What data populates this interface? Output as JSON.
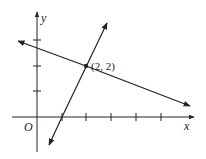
{
  "diagram": {
    "type": "coordinate-plane",
    "axes": {
      "x_label": "x",
      "y_label": "y",
      "origin_label": "O",
      "x_ticks": [
        1,
        2,
        3,
        4,
        5
      ],
      "y_ticks": [
        1,
        2,
        3
      ]
    },
    "lines": [
      {
        "name": "steep-line",
        "points": [
          [
            0.5,
            -1
          ],
          [
            2.8,
            3.8
          ]
        ],
        "passes_through": [
          [
            1,
            0
          ],
          [
            2,
            2
          ]
        ]
      },
      {
        "name": "shallow-line",
        "points": [
          [
            -0.8,
            3.0
          ],
          [
            6.1,
            0.4
          ]
        ],
        "passes_through": [
          [
            2,
            2
          ]
        ]
      }
    ],
    "intersection": {
      "x": 2,
      "y": 2,
      "label": "(2, 2)"
    },
    "colors": {
      "ink": "#222222",
      "background": "#ffffff"
    }
  }
}
